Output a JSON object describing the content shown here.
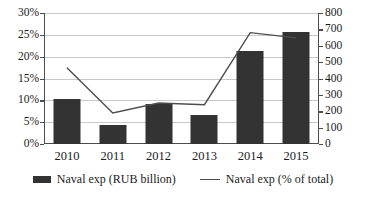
{
  "chart_data": {
    "type": "bar",
    "title": "",
    "xlabel": "",
    "ylabel": "",
    "grid": true,
    "legend_position": "bottom",
    "categories": [
      "2010",
      "2011",
      "2012",
      "2013",
      "2014",
      "2015"
    ],
    "axes": {
      "left": {
        "label": "",
        "ylim": [
          0,
          30
        ],
        "tick_step": 5,
        "ticks": [
          "0%",
          "5%",
          "10%",
          "15%",
          "20%",
          "25%",
          "30%"
        ],
        "tick_values": [
          0,
          5,
          10,
          15,
          20,
          25,
          30
        ],
        "unit": "%"
      },
      "right": {
        "label": "",
        "ylim": [
          0,
          800
        ],
        "tick_step": 100,
        "ticks": [
          "0",
          "100",
          "200",
          "300",
          "400",
          "500",
          "600",
          "700",
          "800"
        ],
        "tick_values": [
          0,
          100,
          200,
          300,
          400,
          500,
          600,
          700,
          800
        ],
        "unit": ""
      }
    },
    "series": [
      {
        "name": "Naval exp (RUB billion)",
        "type": "bar",
        "axis": "left",
        "color": "#333333",
        "values": [
          10.3,
          4.4,
          9.2,
          6.7,
          21.4,
          25.7
        ]
      },
      {
        "name": "Naval exp (% of total)",
        "type": "line",
        "axis": "right",
        "color": "#4d4d4d",
        "values": [
          465,
          190,
          250,
          240,
          680,
          648
        ]
      }
    ]
  },
  "legend": {
    "items": [
      {
        "label": "Naval exp (RUB billion)",
        "marker": "bar-swatch"
      },
      {
        "label": "Naval exp (% of total)",
        "marker": "line-swatch"
      }
    ]
  }
}
